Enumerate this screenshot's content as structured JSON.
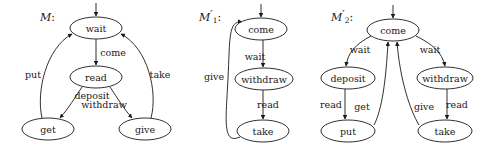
{
  "figure": {
    "caption": "",
    "background": "#ffffff",
    "stroke_color": "#1a1a1a"
  },
  "machines": [
    {
      "id": "M",
      "label_base": "M",
      "label_sub": "",
      "label_prime": "",
      "label_colon": ":",
      "label_x": 40,
      "label_y": 18,
      "nodes": [
        {
          "name": "wait",
          "label": "wait",
          "cx": 96,
          "cy": 28,
          "rx": 26,
          "ry": 11
        },
        {
          "name": "read",
          "label": "read",
          "cx": 96,
          "cy": 77,
          "rx": 26,
          "ry": 11
        },
        {
          "name": "get",
          "label": "get",
          "cx": 48,
          "cy": 129,
          "rx": 26,
          "ry": 11
        },
        {
          "name": "give",
          "label": "give",
          "cx": 145,
          "cy": 129,
          "rx": 26,
          "ry": 11
        }
      ],
      "edges": [
        {
          "from": "start",
          "to": "wait",
          "label": "",
          "label_x": 0,
          "label_y": 0
        },
        {
          "from": "wait",
          "to": "read",
          "label": "come",
          "label_x": 113,
          "label_y": 53
        },
        {
          "from": "read",
          "to": "get",
          "label": "deposit",
          "label_x": 92,
          "label_y": 96
        },
        {
          "from": "read",
          "to": "give",
          "label": "withdraw",
          "label_x": 104,
          "label_y": 105
        },
        {
          "from": "get",
          "to": "wait",
          "label": "put",
          "label_x": 33,
          "label_y": 75
        },
        {
          "from": "give",
          "to": "wait",
          "label": "take",
          "label_x": 160,
          "label_y": 75
        }
      ]
    },
    {
      "id": "M1prime",
      "label_base": "M",
      "label_sub": "1",
      "label_prime": "′",
      "label_colon": ":",
      "label_x": 199,
      "label_y": 18,
      "nodes": [
        {
          "name": "come",
          "label": "come",
          "cx": 261,
          "cy": 29,
          "rx": 26,
          "ry": 11
        },
        {
          "name": "withdraw",
          "label": "withdraw",
          "cx": 264,
          "cy": 79,
          "rx": 29,
          "ry": 11
        },
        {
          "name": "take",
          "label": "take",
          "cx": 263,
          "cy": 131,
          "rx": 26,
          "ry": 11
        }
      ],
      "edges": [
        {
          "from": "start",
          "to": "come",
          "label": "",
          "label_x": 0,
          "label_y": 0
        },
        {
          "from": "come",
          "to": "withdraw",
          "label": "wait",
          "label_x": 255,
          "label_y": 57
        },
        {
          "from": "withdraw",
          "to": "take",
          "label": "read",
          "label_x": 268,
          "label_y": 105
        },
        {
          "from": "take",
          "to": "come",
          "label": "give",
          "label_x": 214,
          "label_y": 77
        }
      ]
    },
    {
      "id": "M2prime",
      "label_base": "M",
      "label_sub": "2",
      "label_prime": "′",
      "label_colon": ":",
      "label_x": 331,
      "label_y": 18,
      "nodes": [
        {
          "name": "come",
          "label": "come",
          "cx": 393,
          "cy": 30,
          "rx": 26,
          "ry": 11
        },
        {
          "name": "deposit",
          "label": "deposit",
          "cx": 348,
          "cy": 78,
          "rx": 27,
          "ry": 11
        },
        {
          "name": "withdraw",
          "label": "withdraw",
          "cx": 445,
          "cy": 78,
          "rx": 28,
          "ry": 11
        },
        {
          "name": "put",
          "label": "put",
          "cx": 348,
          "cy": 131,
          "rx": 27,
          "ry": 11
        },
        {
          "name": "take",
          "label": "take",
          "cx": 445,
          "cy": 131,
          "rx": 27,
          "ry": 11
        }
      ],
      "edges": [
        {
          "from": "start",
          "to": "come",
          "label": "",
          "label_x": 0,
          "label_y": 0
        },
        {
          "from": "come",
          "to": "deposit",
          "label": "wait",
          "label_x": 360,
          "label_y": 50
        },
        {
          "from": "come",
          "to": "withdraw",
          "label": "wait",
          "label_x": 430,
          "label_y": 50
        },
        {
          "from": "deposit",
          "to": "put",
          "label": "read",
          "label_x": 331,
          "label_y": 105
        },
        {
          "from": "withdraw",
          "to": "take",
          "label": "read",
          "label_x": 457,
          "label_y": 105
        },
        {
          "from": "put",
          "to": "come",
          "label": "get",
          "label_x": 362,
          "label_y": 107
        },
        {
          "from": "take",
          "to": "come",
          "label": "give",
          "label_x": 424,
          "label_y": 107
        }
      ]
    }
  ]
}
